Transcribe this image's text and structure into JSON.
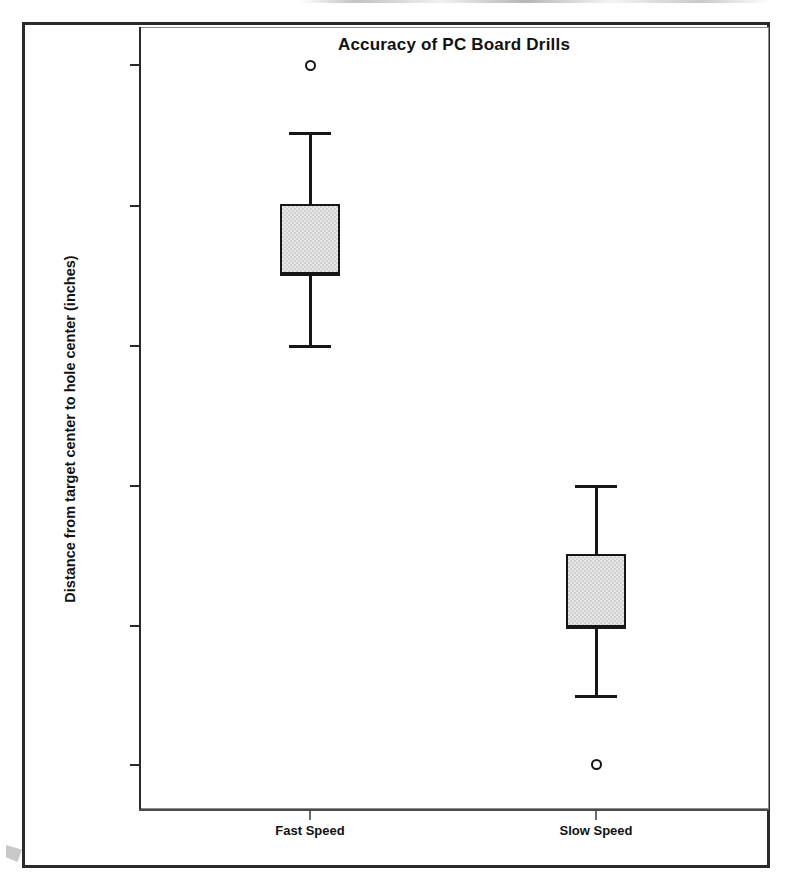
{
  "chart_data": {
    "type": "box",
    "title": "Accuracy of PC Board Drills",
    "xlabel": "",
    "ylabel": "Distance from target center to hole center (inches)",
    "grid": false,
    "legend": "none",
    "y_tick_labels": [
      "0.00010",
      "0.00010",
      "0.00010",
      "0.00010",
      "0.00010",
      "0.00009"
    ],
    "y_tick_pixel_y": [
      62,
      203,
      343,
      483,
      623,
      762
    ],
    "categories": [
      "Fast Speed",
      "Slow Speed"
    ],
    "boxes": [
      {
        "name": "Fast Speed",
        "whisker_low_px": 342,
        "q1_px": 271,
        "median_px": 271,
        "q3_px": 201,
        "whisker_high_px": 129,
        "outliers_px": [
          62
        ],
        "center_px": 307,
        "half_width_px": 30
      },
      {
        "name": "Slow Speed",
        "whisker_low_px": 692,
        "q1_px": 624,
        "median_px": 624,
        "q3_px": 551,
        "whisker_high_px": 482,
        "outliers_px": [
          761
        ],
        "center_px": 593,
        "half_width_px": 30
      }
    ],
    "colors": {
      "box_fill": "#e8e8e8",
      "box_stroke": "#161616",
      "axis": "#2a2a2a",
      "text": "#111111"
    }
  }
}
